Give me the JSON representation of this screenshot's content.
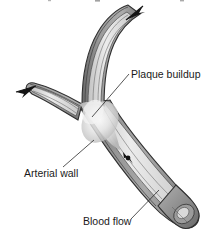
{
  "figure": {
    "background_color": "#ffffff",
    "width": 208,
    "height": 248
  },
  "palette": {
    "outline": "#2f2f2f",
    "wall_dark": "#6f6f6f",
    "wall_mid": "#8d8d8d",
    "wall_light": "#a8a8a8",
    "lumen_light": "#e9e9e9",
    "lumen_mid": "#cfcfcf",
    "plaque_light": "#f2f2f2",
    "plaque_mid": "#d8d8d8",
    "arrow_fill": "#141414",
    "label_color": "#1a1a1a",
    "leader_color": "#2b2b2b"
  },
  "labels": [
    {
      "id": "plaque-buildup",
      "text": "Plaque buildup",
      "x": 131,
      "y": 78,
      "anchor": "start",
      "leader_from": {
        "x": 129,
        "y": 74
      },
      "leader_to": {
        "x": 92,
        "y": 117
      }
    },
    {
      "id": "arterial-wall",
      "text": "Arterial wall",
      "x": 24,
      "y": 177,
      "anchor": "start",
      "leader_from": {
        "x": 63,
        "y": 167
      },
      "leader_to": {
        "x": 94,
        "y": 140
      }
    },
    {
      "id": "blood-flow",
      "text": "Blood flow",
      "x": 83,
      "y": 225,
      "anchor": "start",
      "leader_from": {
        "x": 131,
        "y": 219
      },
      "leader_to": {
        "x": 159,
        "y": 190
      }
    }
  ],
  "arrows": [
    {
      "id": "upper-branch-outflow",
      "description": "blood flow arrow exiting the upper branch",
      "direction": "up-right",
      "x": 133,
      "y": 12
    },
    {
      "id": "left-branch-outflow",
      "description": "blood flow arrow exiting the left branch",
      "direction": "left",
      "x": 22,
      "y": 92
    },
    {
      "id": "lumen-flow-marker",
      "description": "small flow direction arrow inside the main lumen",
      "direction": "down-right",
      "x": 128,
      "y": 158
    }
  ],
  "anatomy": [
    {
      "id": "upper-branch",
      "name": "Upper arterial branch"
    },
    {
      "id": "left-branch",
      "name": "Left arterial branch"
    },
    {
      "id": "main-trunk",
      "name": "Main arterial trunk"
    },
    {
      "id": "plaque-mass",
      "name": "Plaque deposit at bifurcation"
    },
    {
      "id": "cut-end",
      "name": "Cut-away open vessel end"
    }
  ]
}
